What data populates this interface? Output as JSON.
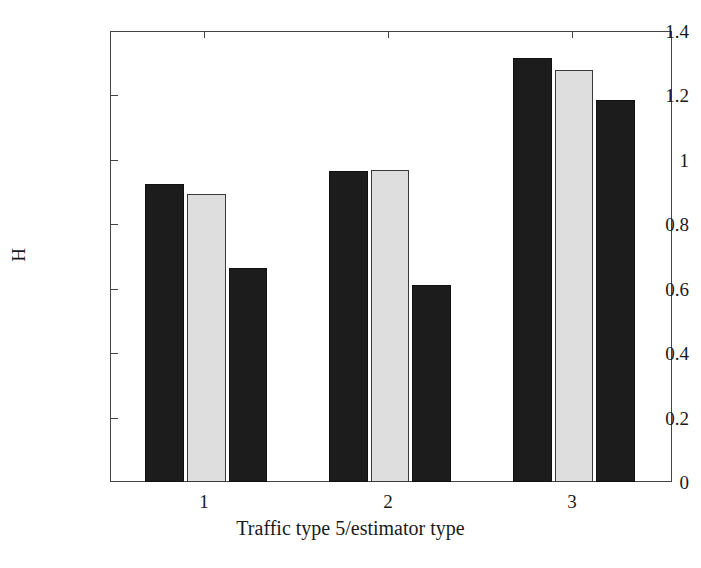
{
  "chart_data": {
    "type": "bar",
    "title": "",
    "subtitle": "",
    "xlabel": "Traffic type 5/estimator type",
    "ylabel": "H",
    "categories": [
      "1",
      "2",
      "3"
    ],
    "xtick_labels": [
      "1",
      "2",
      "3"
    ],
    "ytick_labels": [
      "0",
      "0.2",
      "0.4",
      "0.6",
      "0.8",
      "1",
      "1.2",
      "1.4"
    ],
    "ytick_values": [
      0,
      0.2,
      0.4,
      0.6,
      0.8,
      1,
      1.2,
      1.4
    ],
    "ylim": [
      0,
      1.4
    ],
    "grid": false,
    "legend": "none",
    "series": [
      {
        "name": "estimator 1",
        "color": "#1c1c1c",
        "values": [
          0.925,
          0.965,
          1.317
        ]
      },
      {
        "name": "estimator 2",
        "color": "#dedede",
        "values": [
          0.895,
          0.97,
          1.28
        ]
      },
      {
        "name": "estimator 3",
        "color": "#1c1c1c",
        "values": [
          0.665,
          0.612,
          1.187
        ]
      }
    ],
    "bars": [
      {
        "group": "1",
        "series": "estimator 1",
        "value": 0.925,
        "style": "dark",
        "x": 145,
        "width": 39
      },
      {
        "group": "1",
        "series": "estimator 2",
        "value": 0.895,
        "style": "light",
        "x": 187,
        "width": 39
      },
      {
        "group": "1",
        "series": "estimator 3",
        "value": 0.665,
        "style": "dark",
        "x": 229,
        "width": 38
      },
      {
        "group": "2",
        "series": "estimator 1",
        "value": 0.965,
        "style": "dark",
        "x": 329,
        "width": 39
      },
      {
        "group": "2",
        "series": "estimator 2",
        "value": 0.97,
        "style": "light",
        "x": 371,
        "width": 38
      },
      {
        "group": "2",
        "series": "estimator 3",
        "value": 0.612,
        "style": "dark",
        "x": 412,
        "width": 39
      },
      {
        "group": "3",
        "series": "estimator 1",
        "value": 1.317,
        "style": "dark",
        "x": 513,
        "width": 39
      },
      {
        "group": "3",
        "series": "estimator 2",
        "value": 1.28,
        "style": "light",
        "x": 555,
        "width": 38
      },
      {
        "group": "3",
        "series": "estimator 3",
        "value": 1.187,
        "style": "dark",
        "x": 596,
        "width": 39
      }
    ],
    "group_centers": [
      204,
      388,
      572
    ],
    "colors": {
      "dark_bar": "#1c1c1c",
      "light_bar": "#dedede",
      "light_bar_border": "#3a3a3a",
      "axis": "#444444",
      "background": "#ffffff",
      "text": "#1a1a1a"
    },
    "plot_box": {
      "left": 110,
      "top": 31,
      "width": 562,
      "height": 451
    }
  }
}
